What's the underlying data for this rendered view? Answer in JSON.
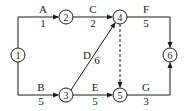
{
  "diagram": {
    "type": "activity-on-arrow network",
    "nodes": [
      {
        "id": "1",
        "label": "1"
      },
      {
        "id": "2",
        "label": "2"
      },
      {
        "id": "3",
        "label": "3"
      },
      {
        "id": "4",
        "label": "4"
      },
      {
        "id": "5",
        "label": "5"
      },
      {
        "id": "6",
        "label": "6"
      }
    ],
    "activities": [
      {
        "name": "A",
        "duration": "1",
        "from": "1",
        "to": "2"
      },
      {
        "name": "B",
        "duration": "5",
        "from": "1",
        "to": "3"
      },
      {
        "name": "C",
        "duration": "2",
        "from": "2",
        "to": "4"
      },
      {
        "name": "D",
        "duration": "6",
        "from": "3",
        "to": "4"
      },
      {
        "name": "E",
        "duration": "5",
        "from": "3",
        "to": "5"
      },
      {
        "name": "F",
        "duration": "5",
        "from": "4",
        "to": "6"
      },
      {
        "name": "G",
        "duration": "3",
        "from": "5",
        "to": "6"
      }
    ],
    "dummies": [
      {
        "from": "4",
        "to": "5",
        "style": "dashed"
      }
    ]
  }
}
